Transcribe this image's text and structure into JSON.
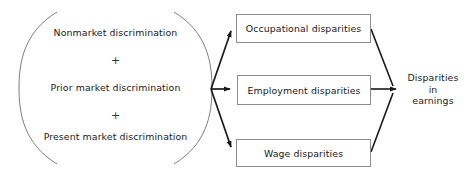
{
  "diagram": {
    "type": "flow-diagram",
    "background_color": "#ffffff",
    "line_color": "#1a1a1a",
    "box_border_color": "#8c8c8c",
    "text_color": "#1a1a1a",
    "source_group": {
      "name": "discrimination-sources",
      "shape": "lens",
      "lines": [
        {
          "text": "Nonmarket discrimination"
        },
        {
          "text": "+"
        },
        {
          "text": "Prior market discrimination"
        },
        {
          "text": "+"
        },
        {
          "text": "Present market discrimination"
        }
      ]
    },
    "intermediate_boxes": [
      {
        "label": "Occupational disparities"
      },
      {
        "label": "Employment disparities"
      },
      {
        "label": "Wage disparities"
      }
    ],
    "outcome": {
      "lines": [
        "Disparities",
        "in",
        "earnings"
      ]
    }
  }
}
